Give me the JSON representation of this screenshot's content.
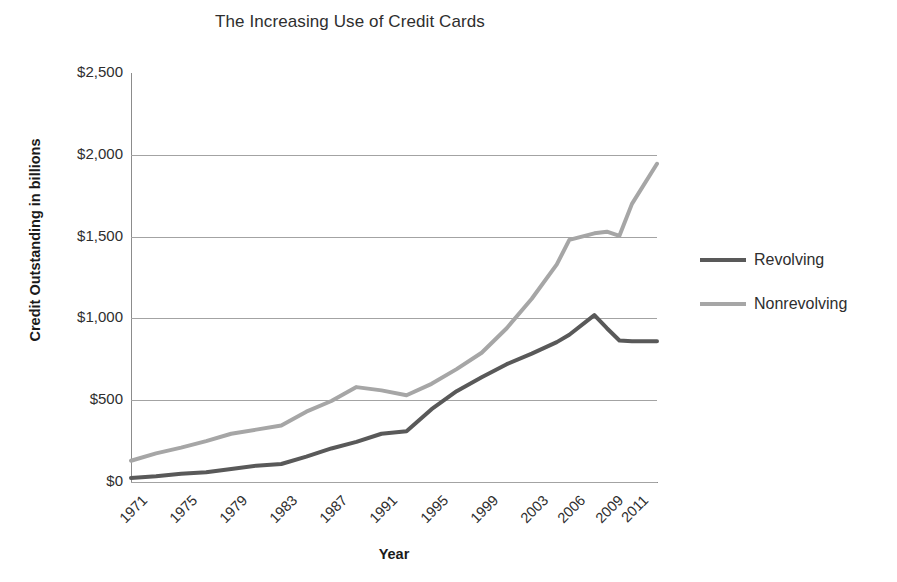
{
  "chart_data": {
    "type": "line",
    "title": "The Increasing Use of Credit Cards",
    "xlabel": "Year",
    "ylabel": "Credit Outstanding in billions",
    "grid": true,
    "legend_position": "right",
    "ylim": [
      0,
      2500
    ],
    "ytick_labels": [
      "$2,500",
      "$2,000",
      "$1,500",
      "$1,000",
      "$500",
      "$0"
    ],
    "ytick_values": [
      2500,
      2000,
      1500,
      1000,
      500,
      0
    ],
    "xtick_labels": [
      "1971",
      "1975",
      "1979",
      "1983",
      "1987",
      "1991",
      "1995",
      "1999",
      "2003",
      "2006",
      "2009",
      "2011"
    ],
    "x": [
      1971,
      1973,
      1975,
      1977,
      1979,
      1981,
      1983,
      1985,
      1987,
      1989,
      1991,
      1993,
      1995,
      1997,
      1999,
      2001,
      2003,
      2005,
      2006,
      2008,
      2009,
      2010,
      2011,
      2013
    ],
    "series": [
      {
        "name": "Revolving",
        "color": "#595959",
        "values": [
          25,
          35,
          50,
          60,
          80,
          100,
          110,
          155,
          205,
          245,
          295,
          310,
          445,
          555,
          640,
          720,
          785,
          855,
          900,
          1020,
          940,
          865,
          860,
          860
        ]
      },
      {
        "name": "Nonrevolving",
        "color": "#a6a6a6",
        "values": [
          130,
          175,
          210,
          250,
          295,
          320,
          345,
          430,
          495,
          580,
          560,
          530,
          600,
          690,
          790,
          940,
          1120,
          1330,
          1480,
          1520,
          1530,
          1505,
          1700,
          1945
        ]
      }
    ]
  },
  "legend": {
    "items": [
      {
        "label": "Revolving",
        "color": "#595959"
      },
      {
        "label": "Nonrevolving",
        "color": "#a6a6a6"
      }
    ]
  }
}
